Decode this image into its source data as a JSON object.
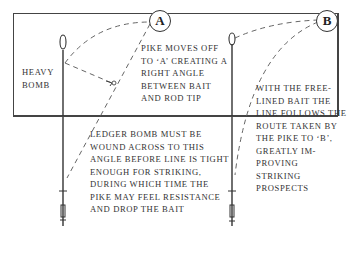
{
  "diagram": {
    "panel_a": {
      "marker": "A",
      "label_weight": "HEAVY\nBOMB",
      "caption_top": "PIKE MOVES OFF\nTO ‘A’ CREATING A\nRIGHT ANGLE\nBETWEEN BAIT\nAND ROD TIP",
      "caption_bottom": "LEDGER BOMB MUST BE\nWOUND ACROSS TO THIS\nANGLE BEFORE LINE IS TIGHT\nENOUGH FOR STRIKING,\nDURING WHICH TIME THE\nPIKE MAY FEEL RESISTANCE\nAND DROP THE BAIT"
    },
    "panel_b": {
      "marker": "B",
      "caption": "WITH THE FREE-\nLINED BAIT THE\nLINE FOLLOWS THE\nROUTE TAKEN BY\nTHE PIKE TO ‘B’,\nGREATLY IM-\nPROVING\nSTRIKING\nPROSPECTS"
    },
    "colors": {
      "line": "#333333",
      "dash": "#666666",
      "background": "#ffffff"
    }
  }
}
